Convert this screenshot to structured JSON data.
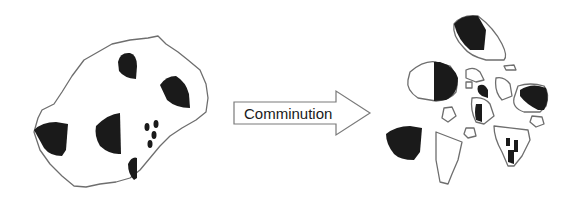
{
  "diagram": {
    "type": "process-illustration",
    "left": {
      "name": "unbroken-ore-particle",
      "description": "Large irregular ore particle with embedded dark mineral grains",
      "grain_count": 9
    },
    "arrow": {
      "label": "Comminution",
      "direction": "right"
    },
    "right": {
      "name": "broken-fragments",
      "description": "Fragments after breakage: some fully liberated dark grains, some locked/partially liberated, many barren fragments",
      "fragment_count": 16
    },
    "colors": {
      "background": "#ffffff",
      "outline": "#6e6e6e",
      "mineral_grain": "#1a1a1a",
      "text": "#1a1a1a"
    }
  }
}
